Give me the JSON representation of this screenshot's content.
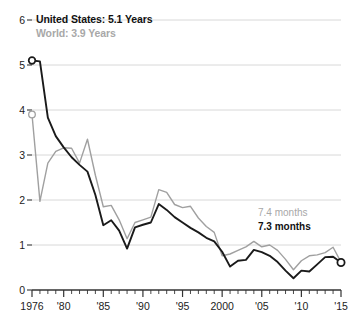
{
  "chart_data": {
    "type": "line",
    "title": "",
    "subtitle": "",
    "xlabel": "",
    "ylabel": "",
    "xlim": [
      1976,
      2015
    ],
    "ylim": [
      0,
      6
    ],
    "grid": true,
    "legend_position": "top-left-inline",
    "y_ticks": [
      "0",
      "1",
      "2",
      "3",
      "4",
      "5",
      "6"
    ],
    "y_tick_values": [
      0,
      1,
      2,
      3,
      4,
      5,
      6
    ],
    "x_ticks": [
      "1976",
      "'80",
      "'85",
      "'90",
      "'95",
      "2000",
      "'05",
      "'10",
      "'15"
    ],
    "x_tick_values": [
      1976,
      1980,
      1985,
      1990,
      1995,
      2000,
      2005,
      2010,
      2015
    ],
    "x_minor_tick_step": 1,
    "x": [
      1976,
      1977,
      1978,
      1979,
      1980,
      1981,
      1982,
      1983,
      1984,
      1985,
      1986,
      1987,
      1988,
      1989,
      1990,
      1991,
      1992,
      1993,
      1994,
      1995,
      1996,
      1997,
      1998,
      1999,
      2000,
      2001,
      2002,
      2003,
      2004,
      2005,
      2006,
      2007,
      2008,
      2009,
      2010,
      2011,
      2012,
      2013,
      2014,
      2015
    ],
    "series": [
      {
        "name": "United States",
        "color": "#1a1a1a",
        "start_label": "United States: 5.1 Years",
        "end_label": "7.3 months",
        "start_value": 5.1,
        "end_value": 0.61,
        "start_marker": true,
        "end_marker": true,
        "values": [
          5.1,
          5.08,
          3.83,
          3.42,
          3.17,
          2.95,
          2.78,
          2.63,
          2.11,
          1.44,
          1.55,
          1.32,
          0.92,
          1.39,
          1.45,
          1.5,
          1.91,
          1.78,
          1.62,
          1.5,
          1.38,
          1.28,
          1.16,
          1.08,
          0.85,
          0.52,
          0.65,
          0.67,
          0.89,
          0.84,
          0.76,
          0.62,
          0.43,
          0.26,
          0.43,
          0.41,
          0.57,
          0.73,
          0.74,
          0.61
        ]
      },
      {
        "name": "World",
        "color": "#a0a0a0",
        "start_label": "World: 3.9 Years",
        "end_label": "7.4 months",
        "start_value": 3.9,
        "end_value": 0.62,
        "start_marker": true,
        "end_marker": false,
        "values": [
          3.9,
          1.97,
          2.82,
          3.08,
          3.16,
          3.15,
          2.82,
          3.35,
          2.55,
          1.85,
          1.88,
          1.56,
          1.14,
          1.5,
          1.56,
          1.62,
          2.23,
          2.17,
          1.9,
          1.83,
          1.86,
          1.6,
          1.41,
          1.28,
          0.76,
          0.8,
          0.88,
          0.96,
          1.08,
          0.96,
          1.0,
          0.88,
          0.68,
          0.45,
          0.65,
          0.76,
          0.78,
          0.83,
          0.95,
          0.62
        ]
      }
    ],
    "annotations": [
      {
        "name": "world-end-label",
        "text": "7.4 months",
        "color": "#a8a8a8",
        "bold": false
      },
      {
        "name": "us-end-label",
        "text": "7.3 months",
        "color": "#111111",
        "bold": true
      }
    ],
    "colors": {
      "us_line": "#1a1a1a",
      "world_line": "#a0a0a0",
      "gridline": "#d8d8d8",
      "axis": "#333333",
      "background": "#ffffff",
      "tick_text": "#222222"
    }
  },
  "legend": {
    "us": "United States: 5.1 Years",
    "world": "World: 3.9 Years"
  },
  "end_labels": {
    "world": "7.4 months",
    "us": "7.3 months"
  }
}
